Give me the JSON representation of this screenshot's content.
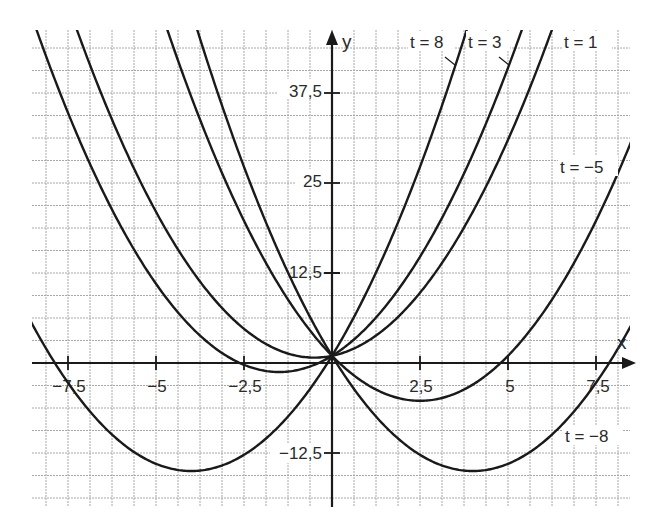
{
  "chart_data": {
    "type": "line",
    "title": "",
    "function_family": "f_t(x) = x^2 + t*x + 1",
    "xlabel": "x",
    "ylabel": "y",
    "xlim": [
      -8.5,
      8.5
    ],
    "ylim": [
      -19.5,
      46.5
    ],
    "grid": true,
    "grid_step_x": 0.625,
    "grid_step_y": 3.125,
    "x_ticks": [
      -7.5,
      -5,
      -2.5,
      2.5,
      5,
      7.5
    ],
    "x_tick_labels": [
      "-7,5",
      "-5",
      "-2,5",
      "2,5",
      "5",
      "7,5"
    ],
    "y_ticks": [
      37.5,
      25,
      12.5,
      -12.5
    ],
    "y_tick_labels": [
      "37,5",
      "25",
      "12,5",
      "-12,5"
    ],
    "legend_position": "inline curve labels",
    "series": [
      {
        "name": "t = 8",
        "t": 8,
        "label": "t = 8",
        "vertex": [
          -4,
          -15
        ],
        "y_intercept": 1
      },
      {
        "name": "t = 3",
        "t": 3,
        "label": "t = 3",
        "vertex": [
          -1.5,
          -1.25
        ],
        "y_intercept": 1
      },
      {
        "name": "t = 1",
        "t": 1,
        "label": "t = 1",
        "vertex": [
          -0.5,
          0.75
        ],
        "y_intercept": 1
      },
      {
        "name": "t = -5",
        "t": -5,
        "label": "t = −5",
        "vertex": [
          2.5,
          -5.25
        ],
        "y_intercept": 1
      },
      {
        "name": "t = -8",
        "t": -8,
        "label": "t = −8",
        "vertex": [
          4,
          -15
        ],
        "y_intercept": 1
      }
    ],
    "common_point": [
      0,
      1
    ]
  },
  "axes": {
    "x_label": "x",
    "y_label": "y"
  },
  "labels": {
    "t8": "t = 8",
    "t3": "t = 3",
    "t1": "t = 1",
    "tm5": "t = −5",
    "tm8": "t = −8"
  },
  "ticks": {
    "x": [
      "−7,5",
      "−5",
      "−2,5",
      "2,5",
      "5",
      "7,5"
    ],
    "y": [
      "37,5",
      "25",
      "12,5",
      "−12,5"
    ]
  },
  "colors": {
    "curve": "#1a1a1a",
    "grid": "#a8a8a8",
    "background": "#ffffff"
  }
}
